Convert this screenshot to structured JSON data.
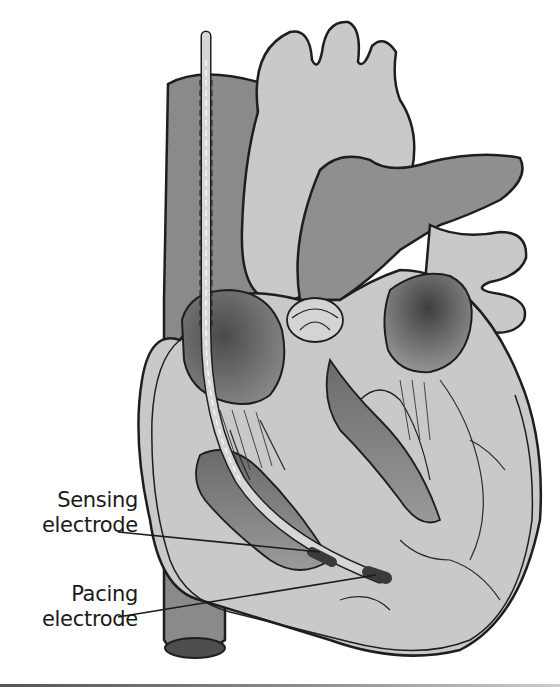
{
  "figure": {
    "labels": [
      {
        "id": "sensing",
        "line1": "Sensing",
        "line2": "electrode"
      },
      {
        "id": "pacing",
        "line1": "Pacing",
        "line2": "electrode"
      }
    ],
    "colors": {
      "outline": "#1e1e1e",
      "light_tissue": "#c9c9c9",
      "mid_tissue": "#8f8f8f",
      "dark_chamber": "#5a5a5a",
      "lead": "#d6d6d6",
      "electrode": "#3a3a3a",
      "background": "#ffffff"
    }
  }
}
